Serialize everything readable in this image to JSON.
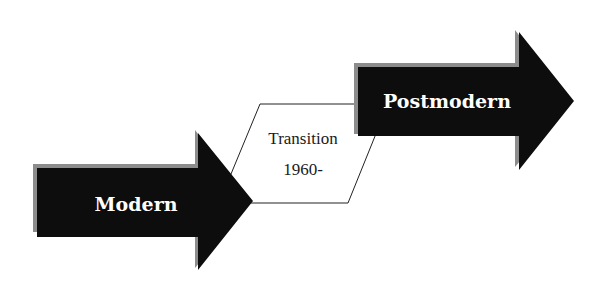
{
  "diagram": {
    "stages": [
      {
        "id": "modern",
        "label": "Modern"
      },
      {
        "id": "transition",
        "label_line1": "Transition",
        "label_line2": "1960-"
      },
      {
        "id": "postmodern",
        "label": "Postmodern"
      }
    ],
    "colors": {
      "arrow_fill": "#0d0d0d",
      "arrow_shadow": "#8c8c8c",
      "box_stroke": "#222222",
      "box_fill": "#ffffff",
      "arrow_text": "#ffffff",
      "box_text": "#1a1a1a"
    }
  }
}
